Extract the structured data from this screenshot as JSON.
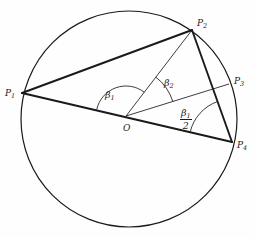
{
  "figure": {
    "type": "geometry-diagram",
    "background_color": "#fefefe",
    "stroke_color": "#1a1a1a"
  },
  "circle": {
    "name": "circumcircle",
    "cx": 129,
    "cy": 119,
    "r": 108,
    "stroke_width": 1.2
  },
  "points": [
    {
      "id": "P1",
      "label": "P",
      "sub": "1",
      "x": 22,
      "y": 93,
      "label_x": 5,
      "label_y": 89
    },
    {
      "id": "P2",
      "label": "P",
      "sub": "2",
      "x": 192,
      "y": 30,
      "label_x": 197,
      "label_y": 19
    },
    {
      "id": "P3",
      "label": "P",
      "sub": "3",
      "x": 229,
      "y": 84,
      "label_x": 234,
      "label_y": 77
    },
    {
      "id": "P4",
      "label": "P",
      "sub": "4",
      "x": 232,
      "y": 142,
      "label_x": 237,
      "label_y": 141
    },
    {
      "id": "O",
      "label": "O",
      "sub": "",
      "x": 126,
      "y": 116,
      "label_x": 123,
      "label_y": 124
    }
  ],
  "segments": [
    {
      "id": "P1-P2",
      "from": "P1",
      "to": "P2",
      "weight": "thick"
    },
    {
      "id": "P1-P4",
      "from": "P1",
      "to": "P4",
      "weight": "thick",
      "note": "chord through center O (diameter-like)"
    },
    {
      "id": "P2-P4",
      "from": "P2",
      "to": "P4",
      "weight": "thick"
    },
    {
      "id": "O-P2",
      "from": "O",
      "to": "P2",
      "weight": "thin"
    },
    {
      "id": "O-P3",
      "from": "O",
      "to": "P3",
      "weight": "thin"
    }
  ],
  "angles": [
    {
      "id": "beta1",
      "label": "β",
      "sub": "1",
      "vertex": "O",
      "between": [
        "P1",
        "P2"
      ],
      "arc_radius": 30,
      "label_x": 105,
      "label_y": 90
    },
    {
      "id": "beta2",
      "label": "β",
      "sub": "2",
      "vertex": "O",
      "between": [
        "P2",
        "P3"
      ],
      "arc_radius": 49,
      "label_x": 164,
      "label_y": 78
    },
    {
      "id": "beta1-half",
      "numerator_label": "β",
      "numerator_sub": "1",
      "denominator_label": "2",
      "vertex": "P4",
      "between": [
        "O",
        "P2"
      ],
      "arc_radius": 43,
      "label_x": 180,
      "label_y": 108
    }
  ]
}
